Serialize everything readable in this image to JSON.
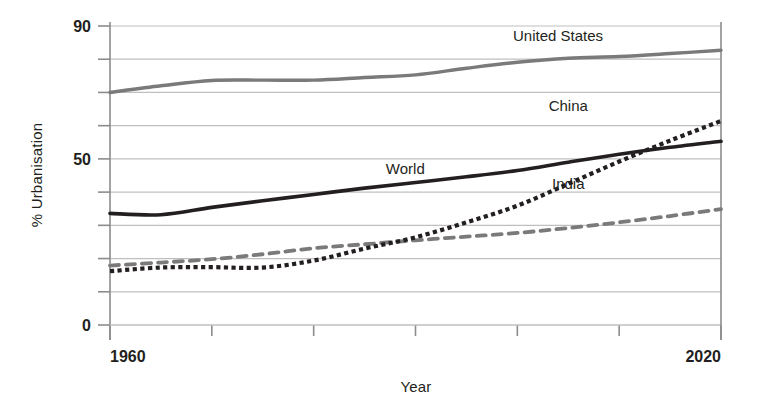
{
  "chart_data": {
    "type": "line",
    "title": "",
    "xlabel": "Year",
    "ylabel": "% Urbanisation",
    "xlim": [
      1960,
      2020
    ],
    "ylim": [
      0,
      90
    ],
    "grid": true,
    "legend_position": "inline-labels",
    "x_tick_labels": [
      "1960",
      "2020"
    ],
    "x_tick_values": [
      1960,
      2020
    ],
    "x_minor_ticks": [
      1970,
      1980,
      1990,
      2000,
      2010
    ],
    "y_tick_labels": [
      "90",
      "50",
      "0"
    ],
    "y_tick_values": [
      90,
      50,
      0
    ],
    "y_gridlines": [
      0,
      10,
      20,
      30,
      40,
      50,
      60,
      70,
      80,
      90
    ],
    "x": [
      1960,
      1965,
      1970,
      1975,
      1980,
      1985,
      1990,
      1995,
      2000,
      2005,
      2010,
      2015,
      2020
    ],
    "series": [
      {
        "name": "United States",
        "color": "#7a7a7a",
        "style": "solid",
        "width": 3.4,
        "label_x": 2004,
        "label_y": 85.5,
        "values": [
          70.0,
          72.0,
          73.6,
          73.7,
          73.7,
          74.5,
          75.3,
          77.3,
          79.1,
          80.3,
          80.8,
          81.7,
          82.7
        ]
      },
      {
        "name": "World",
        "color": "#231f20",
        "style": "solid",
        "width": 3.6,
        "label_x": 1989,
        "label_y": 45.5,
        "values": [
          33.6,
          33.2,
          35.4,
          37.4,
          39.3,
          41.2,
          42.9,
          44.6,
          46.5,
          49.0,
          51.4,
          53.5,
          55.3
        ]
      },
      {
        "name": "China",
        "color": "#231f20",
        "style": "dotted",
        "width": 4.2,
        "label_x": 2005,
        "label_y": 64.5,
        "values": [
          16.2,
          17.3,
          17.4,
          17.3,
          19.4,
          23.0,
          26.4,
          30.9,
          35.9,
          42.5,
          49.2,
          55.5,
          61.4
        ]
      },
      {
        "name": "India",
        "color": "#7a7a7a",
        "style": "dashed",
        "width": 3.8,
        "label_x": 2005,
        "label_y": 41.0,
        "values": [
          17.9,
          18.8,
          19.8,
          21.3,
          23.1,
          24.3,
          25.5,
          26.6,
          27.7,
          29.2,
          30.9,
          32.8,
          34.9
        ]
      }
    ]
  },
  "axes": {
    "y_axis_title": "% Urbanisation",
    "x_axis_title": "Year",
    "y_labels": [
      "90",
      "50",
      "0"
    ],
    "x_labels": [
      "1960",
      "2020"
    ]
  },
  "colors": {
    "grid": "#bfbfbf",
    "axis": "#8c8c8c",
    "dark_series": "#231f20",
    "gray_series": "#7a7a7a",
    "text": "#231f20",
    "background": "#ffffff"
  }
}
